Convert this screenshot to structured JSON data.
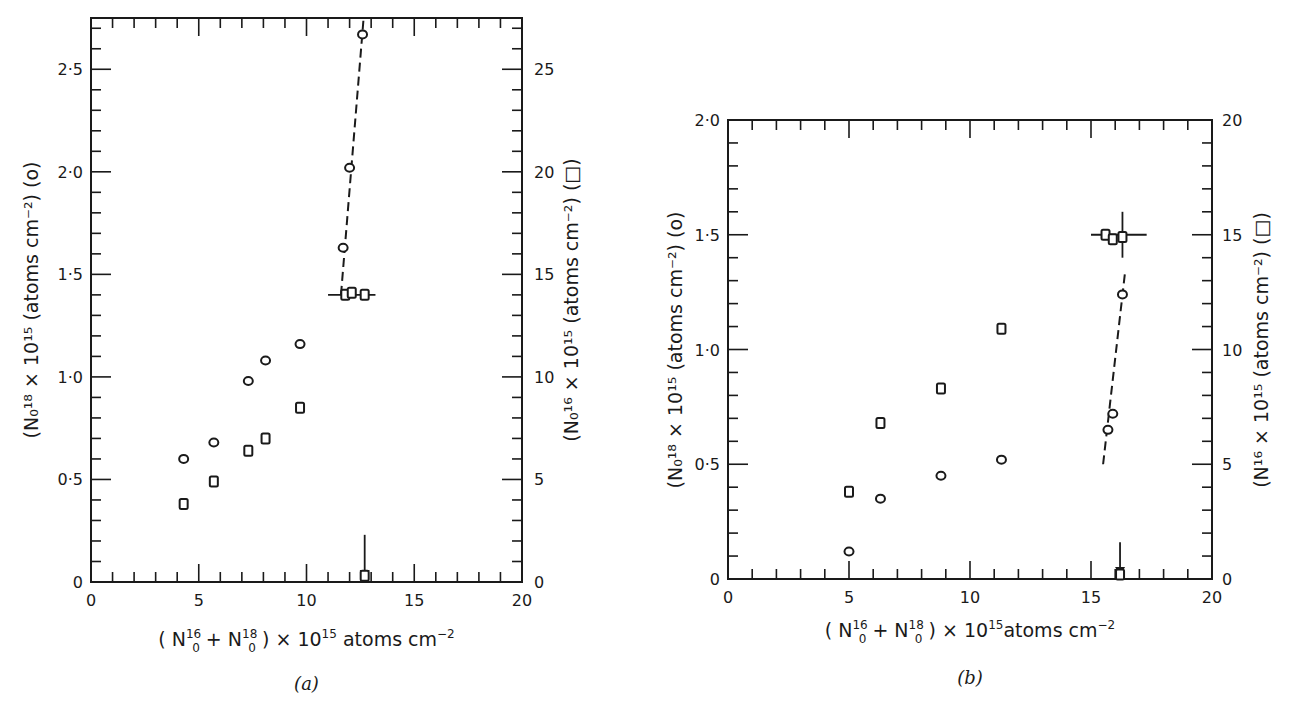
{
  "chart_data": [
    {
      "id": "a",
      "type": "scatter",
      "caption": "(a)",
      "xlabel": "(N0^16 + N0^18) × 10^15 atoms cm^-2",
      "ylabel_left": "(N0^18 × 10^15 (atoms cm^-2) (o)",
      "ylabel_right": "(N0^16 × 10^15 (atoms cm^-2) (□)",
      "xlim": [
        0,
        20
      ],
      "ylim_left": [
        0,
        2.75
      ],
      "ylim_right": [
        0,
        27.5
      ],
      "x_ticks": [
        "0",
        "5",
        "10",
        "15",
        "20"
      ],
      "y_left_ticks": [
        "0",
        "0·5",
        "1·0",
        "1·5",
        "2·0",
        "2·5"
      ],
      "y_right_ticks": [
        "0",
        "5",
        "10",
        "15",
        "20",
        "25"
      ],
      "grid": false,
      "series": [
        {
          "name": "N0^18 (circles, left axis)",
          "marker": "circle",
          "axis": "left",
          "x": [
            4.3,
            5.7,
            7.3,
            8.1,
            9.7,
            11.7,
            12.0,
            12.6
          ],
          "y": [
            0.6,
            0.68,
            0.98,
            1.08,
            1.16,
            1.63,
            2.02,
            2.67
          ]
        },
        {
          "name": "N0^16 (squares, right axis)",
          "marker": "square",
          "axis": "right",
          "x": [
            4.3,
            5.7,
            7.3,
            8.1,
            9.7,
            11.8,
            12.1,
            12.7,
            12.7
          ],
          "y": [
            3.8,
            4.9,
            6.4,
            7.0,
            8.5,
            14.0,
            14.1,
            14.0,
            0.3
          ]
        }
      ],
      "annotations": [
        {
          "type": "dashed-fit",
          "from": [
            11.6,
            1.4
          ],
          "to": [
            12.65,
            2.75
          ],
          "axis": "left"
        },
        {
          "type": "horizontal-bar",
          "x_from": 11.0,
          "x_to": 13.2,
          "y": 14.0,
          "axis": "right"
        },
        {
          "type": "arrow-down",
          "x": 12.7,
          "y_from": 2.3,
          "y_to": 0.0,
          "axis": "right"
        }
      ]
    },
    {
      "id": "b",
      "type": "scatter",
      "caption": "(b)",
      "xlabel": "(N0^16 + N0^18) × 10^15 atoms cm^-2",
      "ylabel_left": "(N0^18 × 10^15 (atoms cm^-2) (o)",
      "ylabel_right": "(N^16 × 10^15 (atoms cm^-2) (□)",
      "xlim": [
        0,
        20
      ],
      "ylim_left": [
        0,
        2.0
      ],
      "ylim_right": [
        0,
        20
      ],
      "x_ticks": [
        "0",
        "5",
        "10",
        "15",
        "20"
      ],
      "y_left_ticks": [
        "0",
        "0·5",
        "1·0",
        "1·5",
        "2·0"
      ],
      "y_right_ticks": [
        "0",
        "5",
        "10",
        "15",
        "20"
      ],
      "grid": false,
      "series": [
        {
          "name": "N0^18 (circles, left axis)",
          "marker": "circle",
          "axis": "left",
          "x": [
            5.0,
            6.3,
            8.8,
            11.3,
            15.7,
            15.9,
            16.3
          ],
          "y": [
            0.12,
            0.35,
            0.45,
            0.52,
            0.65,
            0.72,
            1.24
          ]
        },
        {
          "name": "N^16 (squares, right axis)",
          "marker": "square",
          "axis": "right",
          "x": [
            5.0,
            6.3,
            8.8,
            11.3,
            15.6,
            15.9,
            16.3,
            16.2
          ],
          "y": [
            3.8,
            6.8,
            8.3,
            10.9,
            15.0,
            14.8,
            14.9,
            0.2
          ]
        }
      ],
      "annotations": [
        {
          "type": "dashed-fit",
          "from": [
            15.5,
            0.5
          ],
          "to": [
            16.4,
            1.33
          ],
          "axis": "left"
        },
        {
          "type": "horizontal-bar",
          "x_from": 15.0,
          "x_to": 17.3,
          "y": 15.0,
          "axis": "right"
        },
        {
          "type": "vertical-bar",
          "x": 16.3,
          "y_from": 14.0,
          "y_to": 16.0,
          "axis": "right"
        },
        {
          "type": "arrow-down",
          "x": 16.2,
          "y_from": 1.6,
          "y_to": 0.0,
          "axis": "right"
        }
      ]
    }
  ],
  "panels": {
    "a": {
      "caption": "(a)",
      "x_ticks": [
        "0",
        "5",
        "10",
        "15",
        "20"
      ],
      "y_left_ticks": [
        "0",
        "0·5",
        "1·0",
        "1·5",
        "2·0",
        "2·5"
      ],
      "y_right_ticks": [
        "0",
        "5",
        "10",
        "15",
        "20",
        "25"
      ],
      "xlabel_parts": {
        "open": "( N",
        "sup1": "16",
        "sub1": "0",
        "plus": " + N",
        "sup2": "18",
        "sub2": "0",
        "close": " ) × 10",
        "sup3": "15",
        "tail": " atoms  cm",
        "sup4": "−2"
      },
      "ylabel_left": "(N₀¹⁸ × 10¹⁵ (atoms cm⁻²) (o)",
      "ylabel_right": "(N₀¹⁶ × 10¹⁵ (atoms cm⁻²) (□)"
    },
    "b": {
      "caption": "(b)",
      "x_ticks": [
        "0",
        "5",
        "10",
        "15",
        "20"
      ],
      "y_left_ticks": [
        "0",
        "0·5",
        "1·0",
        "1·5",
        "2·0"
      ],
      "y_right_ticks": [
        "0",
        "5",
        "10",
        "15",
        "20"
      ],
      "xlabel_parts": {
        "open": "( N",
        "sup1": "16",
        "sub1": "0",
        "plus": " + N",
        "sup2": "18",
        "sub2": "0",
        "close": " ) × 10",
        "sup3": "15",
        "tail": "atoms  cm",
        "sup4": "−2"
      },
      "ylabel_left": "(N₀¹⁸ × 10¹⁵ (atoms cm⁻²) (o)",
      "ylabel_right": "(N¹⁶ × 10¹⁵ (atoms cm⁻²) (□)"
    }
  }
}
